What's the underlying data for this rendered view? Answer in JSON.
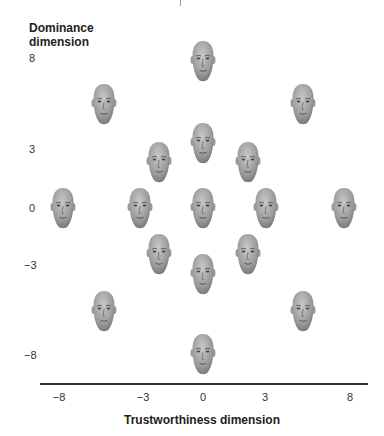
{
  "chart_data": {
    "type": "scatter",
    "title": "",
    "xlabel": "Trustworthiness dimension",
    "ylabel": "Dominance dimension",
    "x_ticks": [
      "−8",
      "−3",
      "0",
      "3",
      "8"
    ],
    "y_ticks": [
      "8",
      "3",
      "0",
      "−3",
      "−8"
    ],
    "xlim": [
      -8,
      8
    ],
    "ylim": [
      -8,
      8
    ],
    "grid": false,
    "legend": null,
    "marker": "face image",
    "points": [
      {
        "x": 0,
        "y": 8
      },
      {
        "x": -5,
        "y": 5
      },
      {
        "x": 5,
        "y": 5
      },
      {
        "x": 0,
        "y": 3.5
      },
      {
        "x": -2.5,
        "y": 2
      },
      {
        "x": 2,
        "y": 2
      },
      {
        "x": -8,
        "y": 0
      },
      {
        "x": -3,
        "y": 0
      },
      {
        "x": 0,
        "y": 0
      },
      {
        "x": 3,
        "y": 0
      },
      {
        "x": 8,
        "y": 0
      },
      {
        "x": -2.5,
        "y": -2
      },
      {
        "x": 2,
        "y": -2
      },
      {
        "x": 0,
        "y": -3.5
      },
      {
        "x": -5,
        "y": -5
      },
      {
        "x": 5,
        "y": -5
      },
      {
        "x": 0,
        "y": -8
      }
    ]
  },
  "labels": {
    "ylabel_line1": "Dominance",
    "ylabel_line2": "dimension",
    "xlabel": "Trustworthiness dimension",
    "y8": "8",
    "y3": "3",
    "y0": "0",
    "ym3": "−3",
    "ym8": "−8",
    "xm8": "−8",
    "xm3": "−3",
    "x0": "0",
    "x3": "3",
    "x8": "8"
  },
  "faces": [
    {
      "left": 190,
      "top": 40
    },
    {
      "left": 91,
      "top": 83
    },
    {
      "left": 290,
      "top": 83
    },
    {
      "left": 190,
      "top": 122
    },
    {
      "left": 146,
      "top": 141
    },
    {
      "left": 235,
      "top": 141
    },
    {
      "left": 50,
      "top": 187
    },
    {
      "left": 127,
      "top": 187
    },
    {
      "left": 190,
      "top": 187
    },
    {
      "left": 253,
      "top": 187
    },
    {
      "left": 331,
      "top": 187
    },
    {
      "left": 146,
      "top": 233
    },
    {
      "left": 235,
      "top": 233
    },
    {
      "left": 190,
      "top": 253
    },
    {
      "left": 91,
      "top": 290
    },
    {
      "left": 290,
      "top": 290
    },
    {
      "left": 190,
      "top": 333
    }
  ]
}
